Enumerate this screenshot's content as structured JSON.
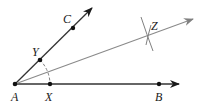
{
  "diagram": {
    "type": "angle-bisector-construction",
    "colors": {
      "main_ray": "#1a1a1a",
      "bisector_ray": "#808080",
      "arc": "#808080",
      "point": "#111111",
      "label": "#1a1a1a"
    },
    "points": {
      "A": {
        "label": "A",
        "x": 15,
        "y": 84
      },
      "X": {
        "label": "X",
        "x": 50,
        "y": 84
      },
      "B": {
        "label": "B",
        "x": 159,
        "y": 84
      },
      "Y": {
        "label": "Y",
        "x": 40,
        "y": 60
      },
      "C": {
        "label": "C",
        "x": 73,
        "y": 28
      },
      "Z": {
        "label": "Z",
        "x": 149,
        "y": 35
      }
    },
    "rays": [
      {
        "name": "ray-AB",
        "from": "A",
        "through": "B"
      },
      {
        "name": "ray-AC",
        "from": "A",
        "through": "C"
      },
      {
        "name": "ray-AZ",
        "from": "A",
        "through": "Z"
      }
    ],
    "arcs": [
      {
        "name": "arc-XY",
        "center": "A",
        "style": "dashed"
      },
      {
        "name": "arc-from-X",
        "center": "X",
        "near": "Z"
      },
      {
        "name": "arc-from-Y",
        "center": "Y",
        "near": "Z"
      }
    ]
  }
}
